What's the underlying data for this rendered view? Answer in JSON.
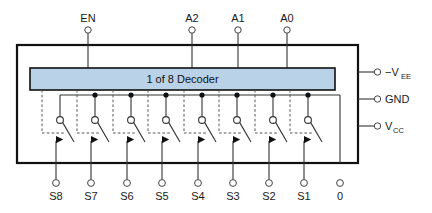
{
  "diagram": {
    "decoder_block": {
      "label": "1 of 8 Decoder",
      "fill_color": "#b9d2e8"
    },
    "outline_color": "#111111",
    "wire_color": "#333333"
  },
  "top_inputs": [
    {
      "name": "enable",
      "label": "EN",
      "x": 88
    },
    {
      "name": "addr2",
      "label": "A2",
      "x": 192
    },
    {
      "name": "addr1",
      "label": "A1",
      "x": 238
    },
    {
      "name": "addr0",
      "label": "A0",
      "x": 287
    }
  ],
  "right_pins": [
    {
      "name": "vee",
      "label": "−V",
      "sub": "EE",
      "y": 72
    },
    {
      "name": "gnd",
      "label": "GND",
      "sub": "",
      "y": 99
    },
    {
      "name": "vcc",
      "label": "V",
      "sub": "CC",
      "y": 126
    }
  ],
  "switches": [
    {
      "name": "switch-s8",
      "label": "S8",
      "x": 60,
      "junction_dot": false
    },
    {
      "name": "switch-s7",
      "label": "S7",
      "x": 95,
      "junction_dot": true
    },
    {
      "name": "switch-s6",
      "label": "S6",
      "x": 131,
      "junction_dot": true
    },
    {
      "name": "switch-s5",
      "label": "S5",
      "x": 166,
      "junction_dot": true
    },
    {
      "name": "switch-s4",
      "label": "S4",
      "x": 202,
      "junction_dot": true
    },
    {
      "name": "switch-s3",
      "label": "S3",
      "x": 237,
      "junction_dot": true
    },
    {
      "name": "switch-s2",
      "label": "S2",
      "x": 273,
      "junction_dot": true
    },
    {
      "name": "switch-s1",
      "label": "S1",
      "x": 308,
      "junction_dot": true
    }
  ],
  "common_terminal": {
    "name": "common",
    "label": "0",
    "x": 340
  }
}
